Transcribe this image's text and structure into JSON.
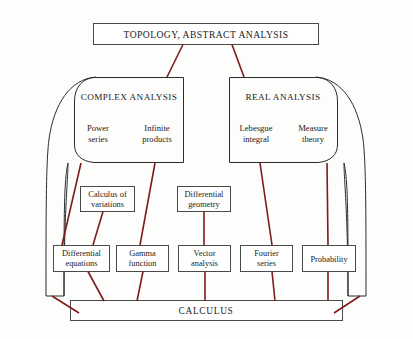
{
  "diagram": {
    "title": "TOPOLOGY, ABSTRACT ANALYSIS",
    "root_label": "TOPOLOGY, ABSTRACT ANALYSIS",
    "base_label": "CALCULUS",
    "colors": {
      "connector": "#7e1b1b",
      "box_border": "#4a4a4a",
      "region_border": "#2b2b2b",
      "background": "#fdfdfc",
      "text": "#1b1b1b"
    },
    "regions": [
      {
        "id": "complex-analysis",
        "label": "COMPLEX ANALYSIS",
        "members": [
          {
            "id": "power-series",
            "line1": "Power",
            "line2": "series"
          },
          {
            "id": "infinite-products",
            "line1": "Infinite",
            "line2": "products"
          }
        ]
      },
      {
        "id": "real-analysis",
        "label": "REAL ANALYSIS",
        "members": [
          {
            "id": "lebesgue-integral",
            "line1": "Lebesgue",
            "line2": "integral"
          },
          {
            "id": "measure-theory",
            "line1": "Measure",
            "line2": "theory"
          }
        ]
      }
    ],
    "mid_nodes": [
      {
        "id": "calculus-of-variations",
        "line1": "Calculus of",
        "line2": "variations"
      },
      {
        "id": "differential-geometry",
        "line1": "Differential",
        "line2": "geometry"
      }
    ],
    "leaf_nodes": [
      {
        "id": "differential-equations",
        "line1": "Differential",
        "line2": "equations"
      },
      {
        "id": "gamma-function",
        "line1": "Gamma",
        "line2": "function"
      },
      {
        "id": "vector-analysis",
        "line1": "Vector",
        "line2": "analysis"
      },
      {
        "id": "fourier-series",
        "line1": "Fourier",
        "line2": "series"
      },
      {
        "id": "probability",
        "line1": "Probability",
        "line2": ""
      }
    ]
  }
}
